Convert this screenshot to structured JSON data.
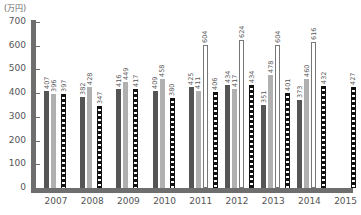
{
  "chart_data": {
    "type": "bar",
    "title": "",
    "unit_label": "(万円)",
    "xlabel": "",
    "ylabel": "(万円)",
    "ylim": [
      0,
      700
    ],
    "yticks": [
      0,
      100,
      200,
      300,
      400,
      500,
      600,
      700
    ],
    "grid": false,
    "legend": null,
    "categories": [
      "2007",
      "2008",
      "2009",
      "2010",
      "2011",
      "2012",
      "2013",
      "2014",
      "2015"
    ],
    "series": [
      {
        "name": "series-dark-gray",
        "color": "#555555",
        "values": [
          407,
          382,
          416,
          409,
          425,
          434,
          351,
          373,
          null
        ]
      },
      {
        "name": "series-light-gray",
        "color": "#b0b0b0",
        "values": [
          396,
          428,
          449,
          458,
          411,
          417,
          478,
          460,
          null
        ]
      },
      {
        "name": "series-white-outline",
        "color": "#ffffff",
        "values": [
          null,
          null,
          null,
          null,
          604,
          624,
          604,
          616,
          null
        ]
      },
      {
        "name": "series-black-dashed",
        "color": "#111111",
        "values": [
          397,
          347,
          417,
          380,
          406,
          434,
          401,
          432,
          427
        ]
      }
    ]
  }
}
